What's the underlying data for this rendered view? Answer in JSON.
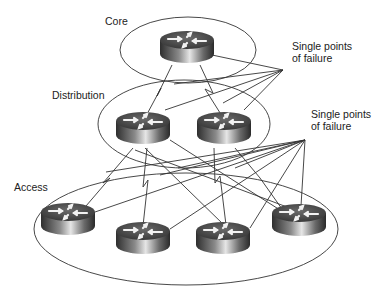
{
  "diagram": {
    "tiers": [
      {
        "name": "Core",
        "label": "Core"
      },
      {
        "name": "Distribution",
        "label": "Distribution"
      },
      {
        "name": "Access",
        "label": "Access"
      }
    ],
    "callouts": [
      {
        "line1": "Single points",
        "line2": "of failure"
      },
      {
        "line1": "Single points",
        "line2": "of failure"
      }
    ],
    "devices": {
      "core": [
        "router"
      ],
      "distribution": [
        "router",
        "router"
      ],
      "access": [
        "router",
        "router",
        "router",
        "router"
      ]
    },
    "colors": {
      "line": "#333333",
      "router_dark": "#3a3a3a",
      "router_light": "#d8d8d8"
    }
  }
}
